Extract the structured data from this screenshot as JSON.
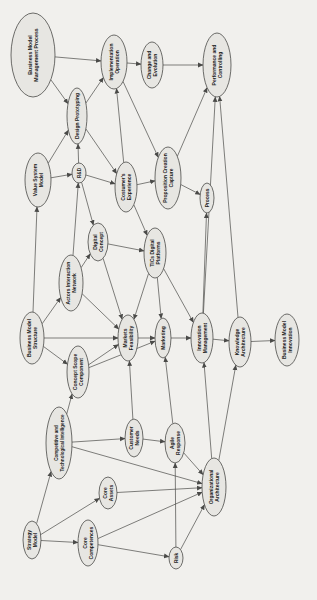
{
  "diagram": {
    "background_color": "#f1f0ed",
    "node_fill_color": "#e7e6e2",
    "node_stroke_color": "#4a4a48",
    "edge_color": "#4a4a48",
    "text_color": "#1c1c1c",
    "text_rotation_deg": -90,
    "nodes": [
      {
        "id": "bmmp",
        "label": "Business Model Management Process",
        "lines": [
          "Business Model",
          "Management Process"
        ],
        "x": 33,
        "y": 55,
        "rx": 22,
        "ry": 42,
        "font": 5.2
      },
      {
        "id": "impl_op",
        "label": "Implementation Operation",
        "lines": [
          "Implementation",
          "Operation"
        ],
        "x": 114,
        "y": 62,
        "rx": 13,
        "ry": 27,
        "font": 5
      },
      {
        "id": "change_evo",
        "label": "Change and Evolution",
        "lines": [
          "Change and",
          "Evolution"
        ],
        "x": 152,
        "y": 65,
        "rx": 11,
        "ry": 23,
        "font": 5
      },
      {
        "id": "perf_ctrl",
        "label": "Performance and Controlling",
        "lines": [
          "Performance and",
          "Controlling"
        ],
        "x": 217,
        "y": 65,
        "rx": 14,
        "ry": 32,
        "font": 5
      },
      {
        "id": "design_proto",
        "label": "Design Prototyping",
        "lines": [
          "Design Prototyping"
        ],
        "x": 77,
        "y": 116,
        "rx": 10,
        "ry": 28,
        "font": 5
      },
      {
        "id": "vsm",
        "label": "Value System Model",
        "lines": [
          "Value System",
          "Model"
        ],
        "x": 38,
        "y": 180,
        "rx": 13,
        "ry": 27,
        "font": 5
      },
      {
        "id": "rd",
        "label": "R&D",
        "lines": [
          "R&D"
        ],
        "x": 79,
        "y": 173,
        "rx": 7,
        "ry": 10,
        "font": 4.6
      },
      {
        "id": "cust_exp",
        "label": "Costumer's Experience",
        "lines": [
          "Costumer's",
          "Experience"
        ],
        "x": 126,
        "y": 187,
        "rx": 11,
        "ry": 25,
        "font": 5
      },
      {
        "id": "prop_cc",
        "label": "Proposition Creation Capture",
        "lines": [
          "Proposition Creation",
          "Capture"
        ],
        "x": 168,
        "y": 178,
        "rx": 13,
        "ry": 31,
        "font": 5
      },
      {
        "id": "process",
        "label": "Process",
        "lines": [
          "Process"
        ],
        "x": 207,
        "y": 198,
        "rx": 7,
        "ry": 15,
        "font": 4.8
      },
      {
        "id": "digital_concept",
        "label": "Digital Concept",
        "lines": [
          "Digital",
          "Concept"
        ],
        "x": 98,
        "y": 242,
        "rx": 10,
        "ry": 19,
        "font": 5
      },
      {
        "id": "tics",
        "label": "TICs Digital Platforms",
        "lines": [
          "TICs Digital",
          "Platforms"
        ],
        "x": 155,
        "y": 253,
        "rx": 11,
        "ry": 25,
        "font": 5
      },
      {
        "id": "ain",
        "label": "Actors Interaction Network",
        "lines": [
          "Actors Interaction",
          "Network"
        ],
        "x": 71,
        "y": 283,
        "rx": 12,
        "ry": 28,
        "font": 5
      },
      {
        "id": "bms",
        "label": "Business Model Structure",
        "lines": [
          "Business Model",
          "Structure"
        ],
        "x": 32,
        "y": 338,
        "rx": 12,
        "ry": 26,
        "font": 5
      },
      {
        "id": "mkts_feas",
        "label": "Markets Feasibility",
        "lines": [
          "Markets",
          "Feasibility"
        ],
        "x": 128,
        "y": 338,
        "rx": 10,
        "ry": 23,
        "font": 5
      },
      {
        "id": "marketing",
        "label": "Marketing",
        "lines": [
          "Marketing"
        ],
        "x": 163,
        "y": 338,
        "rx": 8,
        "ry": 20,
        "font": 5
      },
      {
        "id": "innov_mgmt",
        "label": "Innovation Management",
        "lines": [
          "Innovation",
          "Management"
        ],
        "x": 202,
        "y": 338,
        "rx": 11,
        "ry": 25,
        "font": 5
      },
      {
        "id": "know_arch",
        "label": "Knowledge Architecture",
        "lines": [
          "Knowledge",
          "Architecture"
        ],
        "x": 240,
        "y": 342,
        "rx": 11,
        "ry": 25,
        "font": 5
      },
      {
        "id": "bmi",
        "label": "Business Model Innovation",
        "lines": [
          "Business Model",
          "Innovation"
        ],
        "x": 287,
        "y": 340,
        "rx": 12,
        "ry": 26,
        "font": 5
      },
      {
        "id": "concept_scope",
        "label": "Concept Scope Component",
        "lines": [
          "Concept Scope",
          "Component"
        ],
        "x": 78,
        "y": 372,
        "rx": 11,
        "ry": 26,
        "font": 5
      },
      {
        "id": "cti",
        "label": "Competitive and Technological Intelligence",
        "lines": [
          "Competitive and",
          "Technological Intelligence"
        ],
        "x": 59,
        "y": 443,
        "rx": 13,
        "ry": 36,
        "font": 4.6
      },
      {
        "id": "cust_needs",
        "label": "Customer Needs",
        "lines": [
          "Customer",
          "Needs"
        ],
        "x": 134,
        "y": 438,
        "rx": 9,
        "ry": 19,
        "font": 5
      },
      {
        "id": "agile",
        "label": "Agile Response",
        "lines": [
          "Agile",
          "Response"
        ],
        "x": 175,
        "y": 443,
        "rx": 10,
        "ry": 20,
        "font": 5
      },
      {
        "id": "core_assets",
        "label": "Core Assets",
        "lines": [
          "Core",
          "Assets"
        ],
        "x": 108,
        "y": 493,
        "rx": 9,
        "ry": 16,
        "font": 5
      },
      {
        "id": "org_arch",
        "label": "Organizational Architecture",
        "lines": [
          "Organizational",
          "Architecture"
        ],
        "x": 214,
        "y": 487,
        "rx": 12,
        "ry": 29,
        "font": 5
      },
      {
        "id": "core_comp",
        "label": "Core Competences",
        "lines": [
          "Core",
          "Competences"
        ],
        "x": 88,
        "y": 543,
        "rx": 10,
        "ry": 23,
        "font": 5
      },
      {
        "id": "strategy",
        "label": "Strategy Model",
        "lines": [
          "Strategy",
          "Model"
        ],
        "x": 32,
        "y": 540,
        "rx": 9,
        "ry": 19,
        "font": 5
      },
      {
        "id": "risk",
        "label": "Risk",
        "lines": [
          "Risk"
        ],
        "x": 176,
        "y": 558,
        "rx": 7,
        "ry": 11,
        "font": 4.8
      }
    ],
    "edges": [
      {
        "from": "bmmp",
        "to": "impl_op"
      },
      {
        "from": "bmmp",
        "to": "design_proto"
      },
      {
        "from": "design_proto",
        "to": "impl_op"
      },
      {
        "from": "impl_op",
        "to": "change_evo"
      },
      {
        "from": "change_evo",
        "to": "perf_ctrl"
      },
      {
        "from": "vsm",
        "to": "design_proto"
      },
      {
        "from": "vsm",
        "to": "rd"
      },
      {
        "from": "rd",
        "to": "design_proto"
      },
      {
        "from": "rd",
        "to": "cust_exp"
      },
      {
        "from": "rd",
        "to": "digital_concept"
      },
      {
        "from": "design_proto",
        "to": "cust_exp"
      },
      {
        "from": "cust_exp",
        "to": "prop_cc"
      },
      {
        "from": "cust_exp",
        "to": "impl_op"
      },
      {
        "from": "cust_exp",
        "to": "tics"
      },
      {
        "from": "impl_op",
        "to": "prop_cc"
      },
      {
        "from": "prop_cc",
        "to": "process"
      },
      {
        "from": "prop_cc",
        "to": "perf_ctrl"
      },
      {
        "from": "digital_concept",
        "to": "tics"
      },
      {
        "from": "digital_concept",
        "to": "mkts_feas"
      },
      {
        "from": "tics",
        "to": "mkts_feas"
      },
      {
        "from": "tics",
        "to": "marketing"
      },
      {
        "from": "tics",
        "to": "innov_mgmt"
      },
      {
        "from": "ain",
        "to": "rd"
      },
      {
        "from": "ain",
        "to": "digital_concept"
      },
      {
        "from": "ain",
        "to": "mkts_feas"
      },
      {
        "from": "bms",
        "to": "vsm"
      },
      {
        "from": "bms",
        "to": "ain"
      },
      {
        "from": "bms",
        "to": "concept_scope"
      },
      {
        "from": "bms",
        "to": "mkts_feas"
      },
      {
        "from": "concept_scope",
        "to": "mkts_feas"
      },
      {
        "from": "concept_scope",
        "to": "marketing"
      },
      {
        "from": "mkts_feas",
        "to": "marketing"
      },
      {
        "from": "marketing",
        "to": "innov_mgmt"
      },
      {
        "from": "innov_mgmt",
        "to": "know_arch"
      },
      {
        "from": "know_arch",
        "to": "bmi"
      },
      {
        "from": "innov_mgmt",
        "to": "perf_ctrl"
      },
      {
        "from": "know_arch",
        "to": "perf_ctrl"
      },
      {
        "from": "innov_mgmt",
        "to": "process"
      },
      {
        "from": "cti",
        "to": "concept_scope"
      },
      {
        "from": "cti",
        "to": "cust_needs"
      },
      {
        "from": "cti",
        "to": "org_arch"
      },
      {
        "from": "cust_needs",
        "to": "mkts_feas"
      },
      {
        "from": "cust_needs",
        "to": "agile"
      },
      {
        "from": "agile",
        "to": "marketing"
      },
      {
        "from": "agile",
        "to": "org_arch"
      },
      {
        "from": "risk",
        "to": "agile"
      },
      {
        "from": "risk",
        "to": "org_arch"
      },
      {
        "from": "strategy",
        "to": "cti"
      },
      {
        "from": "strategy",
        "to": "core_assets"
      },
      {
        "from": "strategy",
        "to": "core_comp"
      },
      {
        "from": "core_assets",
        "to": "org_arch"
      },
      {
        "from": "core_comp",
        "to": "org_arch"
      },
      {
        "from": "core_comp",
        "to": "risk"
      },
      {
        "from": "org_arch",
        "to": "innov_mgmt"
      },
      {
        "from": "org_arch",
        "to": "know_arch"
      }
    ]
  }
}
